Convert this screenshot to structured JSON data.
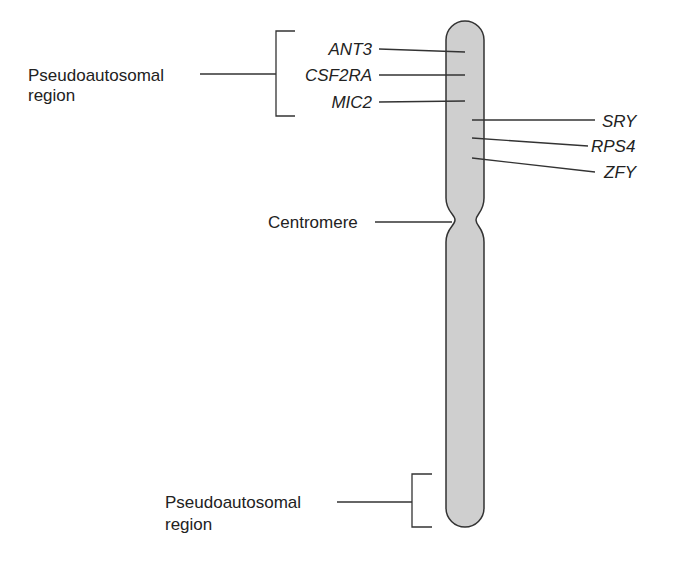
{
  "diagram": {
    "colors": {
      "chromosome_fill": "#cfcfcf",
      "outline": "#333333",
      "text": "#222222",
      "background": "#ffffff"
    },
    "regions": {
      "top_pseudoautosomal": {
        "line1": "Pseudoautosomal",
        "line2": "region"
      },
      "bottom_pseudoautosomal": {
        "line1": "Pseudoautosomal",
        "line2": "region"
      },
      "centromere": "Centromere"
    },
    "genes_left": [
      {
        "name": "ANT3"
      },
      {
        "name": "CSF2RA"
      },
      {
        "name": "MIC2"
      }
    ],
    "genes_right": [
      {
        "name": "SRY"
      },
      {
        "name": "RPS4"
      },
      {
        "name": "ZFY"
      }
    ]
  }
}
